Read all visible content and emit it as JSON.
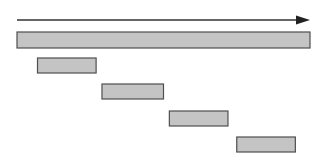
{
  "diagram": {
    "type": "sequential-stages-timeline",
    "colors": {
      "bar_fill": "#c4c4c4",
      "bar_stroke": "#4f4f4f",
      "arrow": "#333333",
      "background": "#ffffff"
    },
    "timeline": {
      "direction": "left-to-right",
      "has_arrow": true
    },
    "overall_bar": {
      "start": 0.0,
      "end": 1.0
    },
    "stages": [
      {
        "index": 1,
        "start": 0.07,
        "end": 0.27
      },
      {
        "index": 2,
        "start": 0.29,
        "end": 0.5
      },
      {
        "index": 3,
        "start": 0.52,
        "end": 0.72
      },
      {
        "index": 4,
        "start": 0.75,
        "end": 0.95
      }
    ]
  }
}
